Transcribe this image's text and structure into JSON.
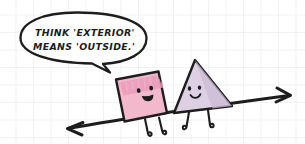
{
  "illustration": {
    "title": "Exterior angle cartoon",
    "style": "hand-drawn-sketch",
    "canvas": {
      "width": 305,
      "height": 144
    },
    "background": {
      "color": "#ffffff",
      "grid": true,
      "grid_color": "#e1e8ec",
      "grid_spacing": 17.5
    },
    "speech_bubble": {
      "speaker": "square-character",
      "lines": [
        "THINK 'EXTERIOR'",
        "MEANS 'OUTSIDE.'"
      ],
      "full_text": "THINK 'EXTERIOR' MEANS 'OUTSIDE.'",
      "outline_color": "#1d1d1d",
      "fill_color": "#ffffff",
      "tail_direction": "down-right"
    },
    "characters": [
      {
        "id": "square-character",
        "shape": "square",
        "fill_color": "#f2b9cc",
        "accent_color": "#ea9cbb",
        "outline_color": "#1d1d1d",
        "expression": "smiling-open-mouth",
        "legs": 2
      },
      {
        "id": "triangle-character",
        "shape": "triangle",
        "fill_color": "#ddd0e4",
        "accent_color": "#cbbcd6",
        "outline_color": "#1d1d1d",
        "expression": "smiling",
        "legs": 2
      }
    ],
    "line": {
      "id": "transversal-line",
      "type": "double-headed-arrow",
      "color": "#1d1d1d",
      "arrowheads": [
        "left",
        "right"
      ]
    }
  }
}
